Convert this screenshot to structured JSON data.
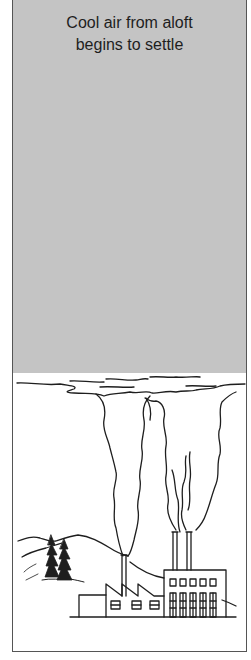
{
  "caption": {
    "line1": "Cool air from aloft",
    "line2": "begins to settle"
  },
  "illustration": {
    "subject": "temperature-inversion",
    "elements": [
      "inversion-layer",
      "smoke-plumes",
      "factory",
      "smokestacks",
      "mountains",
      "pine-trees"
    ],
    "colors": {
      "cool_air_layer": "#c4c4c4",
      "background": "#ffffff",
      "line": "#1e1e1e"
    }
  }
}
